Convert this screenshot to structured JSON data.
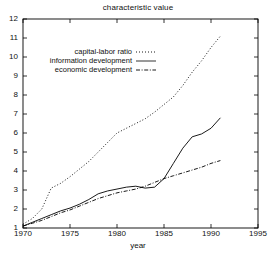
{
  "chart_data": {
    "type": "line",
    "title": "characteristic value",
    "xlabel": "year",
    "ylabel": "",
    "xlim": [
      1970,
      1995
    ],
    "ylim": [
      1,
      12
    ],
    "xticks": [
      1970,
      1975,
      1980,
      1985,
      1990,
      1995
    ],
    "yticks": [
      1,
      2,
      3,
      4,
      5,
      6,
      7,
      8,
      9,
      10,
      11,
      12
    ],
    "grid": false,
    "legend_position": "upper-left",
    "series": [
      {
        "name": "capital-labor ratio",
        "style": "dotted",
        "color": "#000000",
        "x": [
          1970,
          1971,
          1972,
          1973,
          1974,
          1975,
          1976,
          1977,
          1978,
          1979,
          1980,
          1981,
          1982,
          1983,
          1984,
          1985,
          1986,
          1987,
          1988,
          1989,
          1990,
          1991
        ],
        "values": [
          1.2,
          1.5,
          2.0,
          3.1,
          3.35,
          3.7,
          4.1,
          4.5,
          5.0,
          5.5,
          6.0,
          6.25,
          6.5,
          6.75,
          7.1,
          7.5,
          7.9,
          8.5,
          9.2,
          9.8,
          10.5,
          11.1
        ]
      },
      {
        "name": "information development",
        "style": "solid",
        "color": "#000000",
        "x": [
          1970,
          1971,
          1972,
          1973,
          1974,
          1975,
          1976,
          1977,
          1978,
          1979,
          1980,
          1981,
          1982,
          1983,
          1984,
          1985,
          1986,
          1987,
          1988,
          1989,
          1990,
          1991
        ],
        "values": [
          1.1,
          1.3,
          1.5,
          1.7,
          1.9,
          2.05,
          2.25,
          2.5,
          2.8,
          2.95,
          3.05,
          3.15,
          3.2,
          3.1,
          3.15,
          3.6,
          4.4,
          5.2,
          5.8,
          5.95,
          6.25,
          6.8
        ]
      },
      {
        "name": "economic development",
        "style": "dash-dot",
        "color": "#000000",
        "x": [
          1970,
          1971,
          1972,
          1973,
          1974,
          1975,
          1976,
          1977,
          1978,
          1979,
          1980,
          1981,
          1982,
          1983,
          1984,
          1985,
          1986,
          1987,
          1988,
          1989,
          1990,
          1991
        ],
        "values": [
          1.1,
          1.25,
          1.4,
          1.6,
          1.8,
          1.95,
          2.15,
          2.35,
          2.55,
          2.7,
          2.85,
          2.95,
          3.05,
          3.2,
          3.4,
          3.6,
          3.75,
          3.9,
          4.05,
          4.2,
          4.4,
          4.55
        ]
      }
    ]
  },
  "legend": {
    "items": [
      {
        "label": "capital-labor ratio",
        "style": "dotted"
      },
      {
        "label": "information development",
        "style": "solid"
      },
      {
        "label": "economic development",
        "style": "dash-dot"
      }
    ]
  }
}
